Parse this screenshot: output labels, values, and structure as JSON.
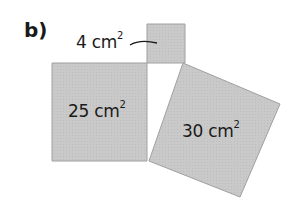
{
  "part_label": "b)",
  "squares": [
    {
      "name": "small",
      "area_value": "4",
      "unit": "cm",
      "exponent": "2"
    },
    {
      "name": "left",
      "area_value": "25",
      "unit": "cm",
      "exponent": "2"
    },
    {
      "name": "tilted",
      "area_value": "30",
      "unit": "cm",
      "exponent": "2"
    }
  ],
  "colors": {
    "fill": "#c8c8c8",
    "stroke": "#9a9a9a",
    "text": "#1a1a1a"
  }
}
